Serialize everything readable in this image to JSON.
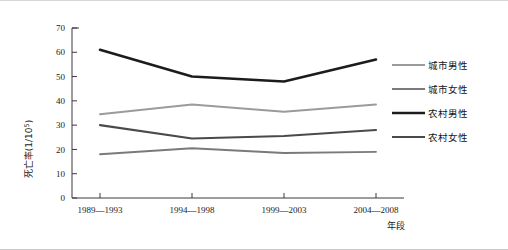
{
  "chart_data": {
    "type": "line",
    "title": "",
    "xlabel": "年段",
    "ylabel": "死亡率(1/10⁵)",
    "ylabel_parts": {
      "text": "死亡率(1/10",
      "sup": "5",
      "tail": ")"
    },
    "categories": [
      "1989—1993",
      "1994—1998",
      "1999—2003",
      "2004—2008"
    ],
    "ylim": [
      0,
      70
    ],
    "yticks": [
      0,
      10,
      20,
      30,
      40,
      50,
      60,
      70
    ],
    "grid": false,
    "legend_position": "right",
    "series": [
      {
        "name": "城市男性",
        "values": [
          34.5,
          38.5,
          35.5,
          38.5
        ],
        "color": "#9b9b9b",
        "width": 1.9
      },
      {
        "name": "城市女性",
        "values": [
          18.0,
          20.5,
          18.5,
          19.0
        ],
        "color": "#7a7a7a",
        "width": 1.9
      },
      {
        "name": "农村男性",
        "values": [
          61.0,
          50.0,
          48.0,
          57.0
        ],
        "color": "#1c1c1c",
        "width": 2.6
      },
      {
        "name": "农村女性",
        "values": [
          30.0,
          24.5,
          25.5,
          28.0
        ],
        "color": "#4a4a4a",
        "width": 2.1
      }
    ]
  },
  "legend": {
    "items": [
      {
        "label": "城市男性"
      },
      {
        "label": "城市女性"
      },
      {
        "label": "农村男性"
      },
      {
        "label": "农村女性"
      }
    ]
  },
  "axes": {
    "y_tick_labels": [
      "70",
      "60",
      "50",
      "40",
      "30",
      "20",
      "10",
      "0"
    ],
    "x_tick_labels": [
      "1989—1993",
      "1994—1998",
      "1999—2003",
      "2004—2008"
    ],
    "x_axis_title": "年段"
  }
}
